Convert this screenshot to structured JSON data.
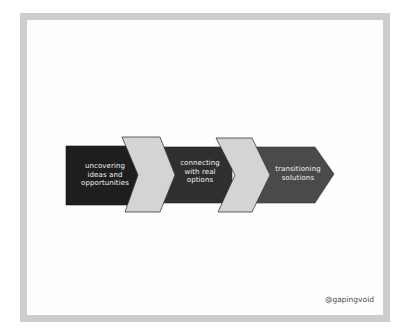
{
  "diagram": {
    "type": "process-chevron-flow",
    "steps": [
      {
        "lines": [
          "uncovering",
          "ideas and",
          "opportunities"
        ],
        "text": "uncovering ideas and opportunities",
        "fill": "#1e1e1e"
      },
      {
        "lines": [
          "connecting",
          "with real",
          "options"
        ],
        "text": "connecting with real options",
        "fill": "#2f2f2f"
      },
      {
        "lines": [
          "transitioning",
          "solutions"
        ],
        "text": "transitioning solutions",
        "fill": "#4a4a4a"
      }
    ],
    "connector_fill": "#d4d4d4",
    "connector_stroke": "#3a3a3a"
  },
  "frame": {
    "border_color": "#cdcdcd",
    "background": "#fefefe"
  },
  "signature": "@gapingvoid"
}
